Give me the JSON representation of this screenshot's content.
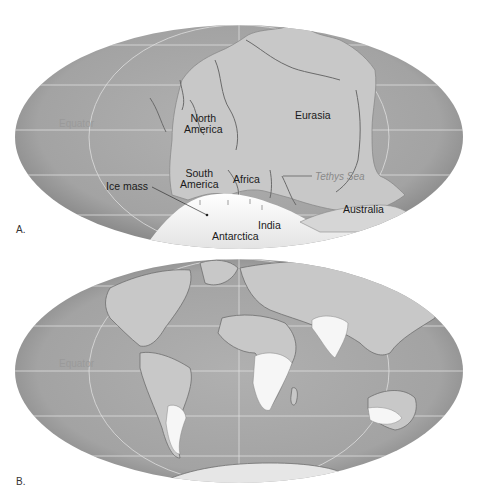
{
  "figure": {
    "panels": [
      {
        "id": "A",
        "letter": "A.",
        "equator_label": "Equator",
        "labels": {
          "north_america": "North\nAmerica",
          "north_america_line1": "North",
          "north_america_line2": "America",
          "eurasia": "Eurasia",
          "south_america_line1": "South",
          "south_america_line2": "America",
          "africa": "Africa",
          "tethys_sea": "Tethys Sea",
          "ice_mass": "Ice mass",
          "australia": "Australia",
          "india": "India",
          "antarctica": "Antarctica"
        }
      },
      {
        "id": "B",
        "letter": "B.",
        "equator_label": "Equator"
      }
    ],
    "colors": {
      "ocean": "#a6a6a6",
      "ocean_edge": "#7e7e7e",
      "land": "#c9c9c9",
      "ice": "#f4f4f4",
      "grid": "#e0e0e0",
      "text": "#1a1a1a",
      "equator_text": "#9a9a9a"
    }
  }
}
